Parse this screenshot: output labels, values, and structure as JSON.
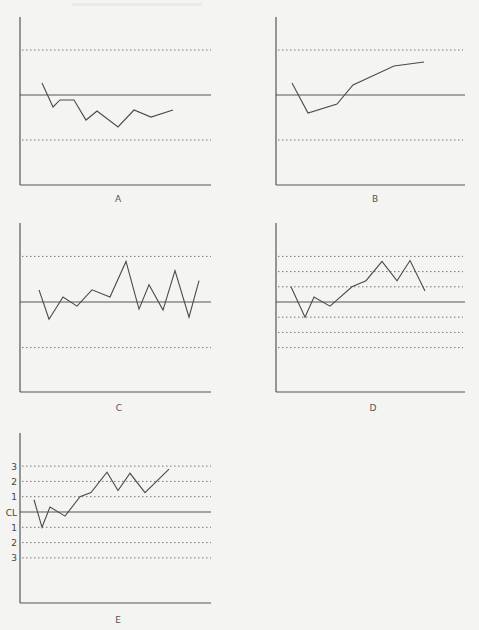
{
  "chart_data": [
    {
      "type": "line",
      "panel": "A",
      "title": "A",
      "xlabel": "",
      "ylabel": "",
      "center_line": 0,
      "limit_lines_sigma": [
        3,
        -3
      ],
      "ylim_sigma": [
        -6,
        5
      ],
      "grid": false,
      "x": [
        1,
        2,
        3,
        4,
        5,
        6,
        7,
        8,
        9,
        10
      ],
      "values": [
        0.8,
        -0.8,
        -0.33,
        -0.33,
        -1.67,
        -1.07,
        -2.13,
        -1.0,
        -1.47,
        -1.0
      ]
    },
    {
      "type": "line",
      "panel": "B",
      "title": "B",
      "xlabel": "",
      "ylabel": "",
      "center_line": 0,
      "limit_lines_sigma": [
        3,
        -3
      ],
      "ylim_sigma": [
        -6,
        5
      ],
      "grid": false,
      "x": [
        1,
        2,
        4,
        5,
        8,
        10
      ],
      "values": [
        0.8,
        -1.2,
        -0.6,
        0.67,
        1.93,
        2.2
      ]
    },
    {
      "type": "line",
      "panel": "C",
      "title": "C",
      "xlabel": "",
      "ylabel": "",
      "center_line": 0,
      "limit_lines_sigma": [
        3,
        -3
      ],
      "ylim_sigma": [
        -6,
        5
      ],
      "grid": false,
      "x": [
        1,
        2,
        3,
        4,
        5,
        6,
        7,
        8,
        9,
        10,
        11,
        12,
        13
      ],
      "values": [
        0.8,
        -1.13,
        0.33,
        -0.27,
        0.8,
        0.33,
        2.67,
        -0.47,
        1.13,
        -0.53,
        2.07,
        -1.0,
        1.4
      ]
    },
    {
      "type": "line",
      "panel": "D",
      "title": "D",
      "xlabel": "",
      "ylabel": "",
      "center_line": 0,
      "limit_lines_sigma": [
        3,
        2,
        1,
        -1,
        -2,
        -3
      ],
      "ylim_sigma": [
        -6,
        5
      ],
      "grid": false,
      "x": [
        1,
        2,
        3,
        4,
        5,
        6,
        7,
        8,
        9,
        10
      ],
      "values": [
        1.0,
        -1.0,
        0.33,
        -0.27,
        1.0,
        1.4,
        2.67,
        1.4,
        2.73,
        0.73
      ]
    },
    {
      "type": "line",
      "panel": "E",
      "title": "E",
      "xlabel": "",
      "ylabel": "",
      "center_line": 0,
      "limit_lines_sigma": [
        3,
        2,
        1,
        -1,
        -2,
        -3
      ],
      "ytick_labels": [
        "3",
        "2",
        "1",
        "CL",
        "1",
        "2",
        "3"
      ],
      "ytick_values": [
        3,
        2,
        1,
        0,
        -1,
        -2,
        -3
      ],
      "ylim_sigma": [
        -6,
        5
      ],
      "grid": false,
      "x": [
        1,
        2,
        3,
        4,
        5,
        6,
        7,
        8,
        9,
        10,
        11
      ],
      "values": [
        0.8,
        -1.0,
        0.33,
        -0.27,
        1.0,
        1.27,
        2.6,
        1.4,
        2.53,
        1.27,
        2.8
      ]
    }
  ],
  "colors": {
    "background": "#f4f4f2",
    "line": "#4a4a4a",
    "axis": "#555555"
  }
}
